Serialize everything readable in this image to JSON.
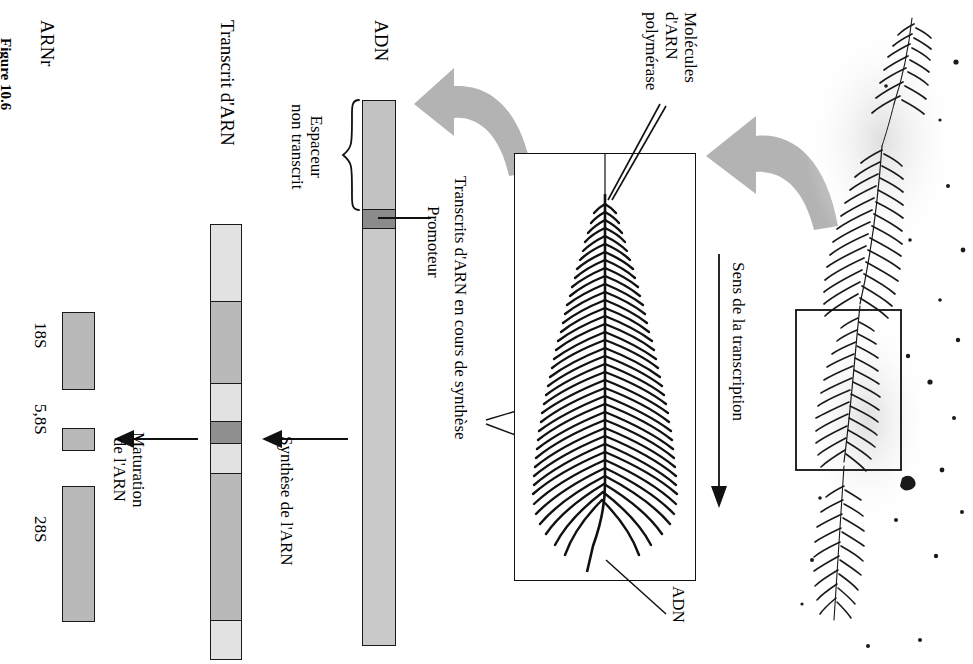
{
  "figure": {
    "caption": "Figure 10.6",
    "language": "fr"
  },
  "labels": {
    "arnr": "ARNr",
    "transcrit_arn": "Transcrit d'ARN",
    "adn_left": "ADN",
    "adn_micrograph": "ADN",
    "espaceur": "Espaceur\nnon transcrit",
    "espaceur_line1": "Espaceur",
    "espaceur_line2": "non transcrit",
    "promoteur": "Promoteur",
    "maturation_line1": "Maturation",
    "maturation_line2": "de l'ARN",
    "synthese": "Synthèse de l'ARN",
    "transcrits_en_cours": "Transcrits d'ARN en cours de synthèse",
    "molecules_line1": "Molécules",
    "molecules_line2": "d'ARN",
    "molecules_line3": "polymérase",
    "sens_transcription": "Sens de la transcription"
  },
  "rrna_products": [
    {
      "name": "18S",
      "label": "18S",
      "length_rel": 78,
      "fill": "#b9b9b9"
    },
    {
      "name": "5.8S",
      "label": "5,8S",
      "length_rel": 22,
      "fill": "#b9b9b9"
    },
    {
      "name": "28S",
      "label": "28S",
      "length_rel": 135,
      "fill": "#b9b9b9"
    }
  ],
  "transcript_segments": [
    {
      "region": "spacer-5prime",
      "type": "spacer",
      "fill": "#e2e2e2",
      "span": 76
    },
    {
      "region": "18S",
      "type": "rrna",
      "fill": "#b9b9b9",
      "span": 82
    },
    {
      "region": "spacer-its1",
      "type": "spacer",
      "fill": "#e2e2e2",
      "span": 38
    },
    {
      "region": "5.8S",
      "type": "rrna",
      "fill": "#9c9c9c",
      "span": 22
    },
    {
      "region": "spacer-its2",
      "type": "spacer",
      "fill": "#e2e2e2",
      "span": 30
    },
    {
      "region": "28S",
      "type": "rrna",
      "fill": "#b9b9b9",
      "span": 147
    },
    {
      "region": "spacer-3prime",
      "type": "spacer",
      "fill": "#e2e2e2",
      "span": 28
    }
  ],
  "dna_segments": [
    {
      "region": "espaceur-non-transcrit",
      "fill": "#c2c2c2",
      "span": 108
    },
    {
      "region": "promoteur",
      "fill": "#8b8b8b",
      "span": 19
    },
    {
      "region": "unite-de-transcription",
      "fill": "#c9c9c9",
      "span": 419
    }
  ],
  "colors": {
    "outline": "#1a1a1a",
    "arrow_gray": "#b3b3b3",
    "panel_border": "#111111",
    "background": "#ffffff"
  },
  "icons": {
    "arrow_maturation": "arrow-left-icon",
    "arrow_synthese": "arrow-left-icon",
    "arrow_zoom_1": "curved-arrow-icon",
    "arrow_zoom_2": "curved-arrow-icon",
    "arrow_direction": "arrow-down-icon",
    "brace": "curly-brace-icon"
  }
}
